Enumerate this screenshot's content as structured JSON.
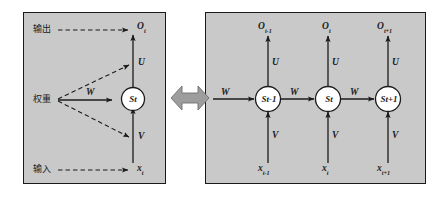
{
  "figure": {
    "background_color": "#ffffff",
    "panel_fill": "#c9c9c9",
    "panel_border": "#1a1a1a",
    "line_color": "#1b1b1b",
    "node_fill": "#ffffff",
    "equiv_arrow_color": "#9d9d9d"
  },
  "folded_panel": {
    "name": "folded-rnn",
    "annotations": {
      "output_label": "输出",
      "weight_label": "权重",
      "input_label": "输入"
    },
    "output_var": "O",
    "output_sub": "t",
    "input_var": "x",
    "input_sub": "t",
    "state_var": "S",
    "state_sub": "t",
    "weight_up": "U",
    "weight_recurrent": "W",
    "weight_down": "V"
  },
  "equivalence": {
    "symbol_name": "double-headed-arrow",
    "meaning": "is equivalent to"
  },
  "unfolded_panel": {
    "name": "unfolded-rnn",
    "recurrent_in_label": "W",
    "steps": [
      {
        "index": 0,
        "output_var": "O",
        "output_sub": "t-1",
        "state_var": "S",
        "state_sub": "t-1",
        "input_var": "x",
        "input_sub": "t-1",
        "weight_up": "U",
        "weight_down": "V",
        "weight_out": "W"
      },
      {
        "index": 1,
        "output_var": "O",
        "output_sub": "t",
        "state_var": "S",
        "state_sub": "t",
        "input_var": "x",
        "input_sub": "t",
        "weight_up": "U",
        "weight_down": "V",
        "weight_out": "W"
      },
      {
        "index": 2,
        "output_var": "O",
        "output_sub": "t+1",
        "state_var": "S",
        "state_sub": "t+1",
        "input_var": "x",
        "input_sub": "t+1",
        "weight_up": "U",
        "weight_down": "V",
        "weight_out": ""
      }
    ]
  }
}
